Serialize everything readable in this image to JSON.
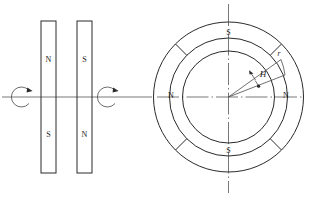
{
  "figure": {
    "stroke_color": "#2a2a2a",
    "axis_color": "#555555",
    "background": "#ffffff"
  },
  "left_panel": {
    "name": "two-bar-magnets",
    "magnet_a": {
      "top_pole": "N",
      "bottom_pole": "S"
    },
    "magnet_b": {
      "top_pole": "S",
      "bottom_pole": "N"
    },
    "rotation_arrow_left": "rotation-arrow",
    "rotation_arrow_right": "rotation-arrow"
  },
  "right_panel": {
    "name": "magnetized-ring",
    "poles": {
      "top": "S",
      "bottom": "S",
      "left": "N",
      "right": "N"
    },
    "field_label": "H",
    "radius_label": "r"
  }
}
